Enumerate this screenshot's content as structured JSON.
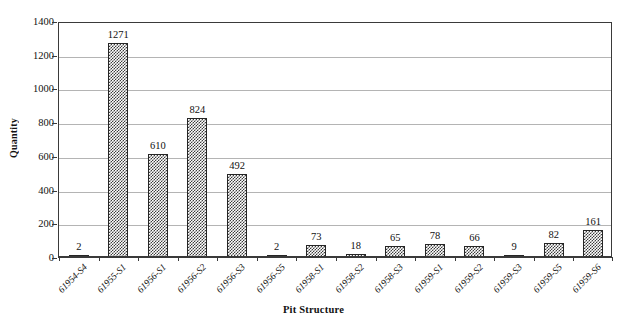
{
  "chart_data": {
    "type": "bar",
    "title": "",
    "xlabel": "Pit Structure",
    "ylabel": "Quantity",
    "categories": [
      "61954-S4",
      "61955-S1",
      "61956-S1",
      "61956-S2",
      "61956-S3",
      "61956-S5",
      "61958-S1",
      "61958-S2",
      "61958-S3",
      "61959-S1",
      "61959-S2",
      "61959-S3",
      "61959-S5",
      "61959-S6"
    ],
    "values": [
      2,
      1271,
      610,
      824,
      492,
      2,
      73,
      18,
      65,
      78,
      66,
      9,
      82,
      161
    ],
    "value_labels": [
      "2",
      "1271",
      "610",
      "824",
      "492",
      "2",
      "73",
      "18",
      "65",
      "78",
      "66",
      "9",
      "82",
      "161"
    ],
    "ylim": [
      0,
      1400
    ],
    "ytick_step": 200,
    "ytick_labels": [
      "0",
      "200",
      "400",
      "600",
      "800",
      "1000",
      "1200",
      "1400"
    ],
    "grid": true,
    "legend": false,
    "bar_fill": "checkerboard-pattern",
    "bar_outline_color": "#262626",
    "gridline_color": "#b4b4b4",
    "axis_color": "#3a3a3a",
    "background_color": "#ffffff"
  }
}
